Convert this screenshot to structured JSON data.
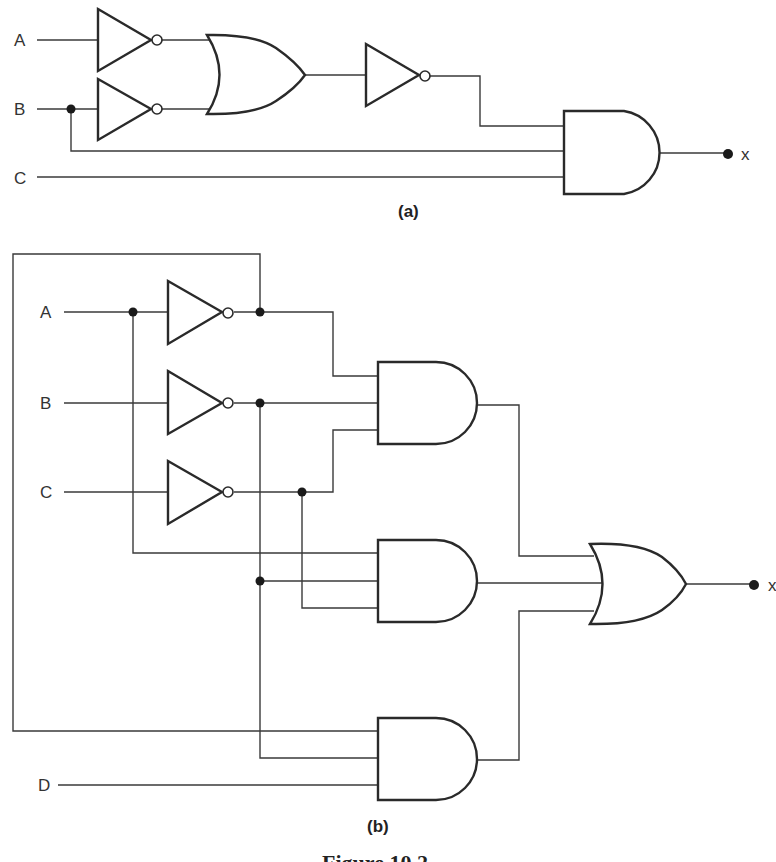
{
  "figure": {
    "caption": "Figure 10.2",
    "stroke_color": "#2a2a2a",
    "background": "#ffffff"
  },
  "circuit_a": {
    "label": "(a)",
    "inputs": [
      "A",
      "B",
      "C"
    ],
    "output": "x",
    "gates": [
      {
        "id": "not_a",
        "type": "NOT",
        "input": "A"
      },
      {
        "id": "not_b",
        "type": "NOT",
        "input": "B"
      },
      {
        "id": "or1",
        "type": "OR",
        "inputs": [
          "not_a",
          "not_b"
        ]
      },
      {
        "id": "not_or",
        "type": "NOT",
        "input": "or1"
      },
      {
        "id": "and1",
        "type": "AND",
        "inputs": [
          "not_or",
          "B",
          "C"
        ]
      }
    ],
    "expression": "x = NOT(NOT A + NOT B) · B · C"
  },
  "circuit_b": {
    "label": "(b)",
    "inputs": [
      "A",
      "B",
      "C",
      "D"
    ],
    "output": "x",
    "gates": [
      {
        "id": "not_a",
        "type": "NOT",
        "input": "A"
      },
      {
        "id": "not_b",
        "type": "NOT",
        "input": "B"
      },
      {
        "id": "not_c",
        "type": "NOT",
        "input": "C"
      },
      {
        "id": "and1",
        "type": "AND",
        "inputs": [
          "not_a",
          "not_b",
          "not_c"
        ]
      },
      {
        "id": "and2",
        "type": "AND",
        "inputs": [
          "A",
          "not_b",
          "not_c"
        ]
      },
      {
        "id": "and3",
        "type": "AND",
        "inputs": [
          "not_a",
          "not_b",
          "D"
        ]
      },
      {
        "id": "or1",
        "type": "OR",
        "inputs": [
          "and1",
          "and2",
          "and3"
        ]
      }
    ],
    "expression": "x = A'B'C' + AB'C' + A'B'D"
  }
}
